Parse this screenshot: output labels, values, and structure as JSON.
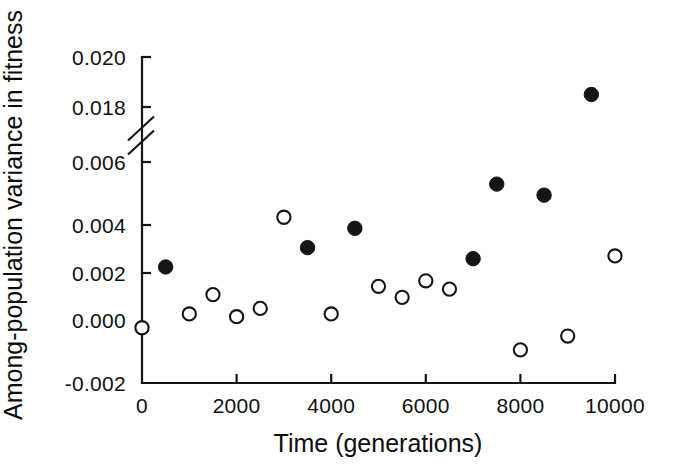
{
  "figure": {
    "background_color": "#ffffff",
    "ink_color": "#151515",
    "width": 689,
    "height": 476
  },
  "chart_data": {
    "type": "scatter",
    "title": "",
    "xlabel": "Time (generations)",
    "ylabel": "Among-population variance in fitness",
    "xlim": [
      0,
      10000
    ],
    "ylim": [
      -0.002,
      0.02
    ],
    "grid": false,
    "legend": "none",
    "axis_break": {
      "present": true,
      "axis": "y",
      "between": [
        0.006,
        0.018
      ],
      "marker": "double-slash"
    },
    "xticks": [
      0,
      2000,
      4000,
      6000,
      8000,
      10000
    ],
    "xticklabels": [
      "0",
      "2000",
      "4000",
      "6000",
      "8000",
      "10000"
    ],
    "yticks": [
      -0.002,
      0.0,
      0.002,
      0.004,
      0.006,
      0.018,
      0.02
    ],
    "yticklabels": [
      "-0.002",
      "0.000",
      "0.002",
      "0.004",
      "0.006",
      "0.018",
      "0.020"
    ],
    "series": [
      {
        "name": "closed-circles",
        "marker": "filled-circle",
        "marker_color": "#151515",
        "x": [
          500,
          3500,
          4500,
          7000,
          7500,
          8500,
          9500
        ],
        "y": [
          0.0022,
          0.0029,
          0.0036,
          0.0025,
          0.0052,
          0.0048,
          0.0185
        ]
      },
      {
        "name": "open-circles",
        "marker": "open-circle",
        "marker_color": "#151515",
        "x": [
          0,
          1000,
          1500,
          2000,
          2500,
          3000,
          4000,
          5000,
          5500,
          6000,
          6500,
          8000,
          9000,
          10000
        ],
        "y": [
          0.0,
          0.0005,
          0.0012,
          0.0004,
          0.0007,
          0.004,
          0.0005,
          0.0015,
          0.0011,
          0.0017,
          0.0014,
          -0.0008,
          -0.0003,
          0.0026
        ]
      }
    ]
  }
}
